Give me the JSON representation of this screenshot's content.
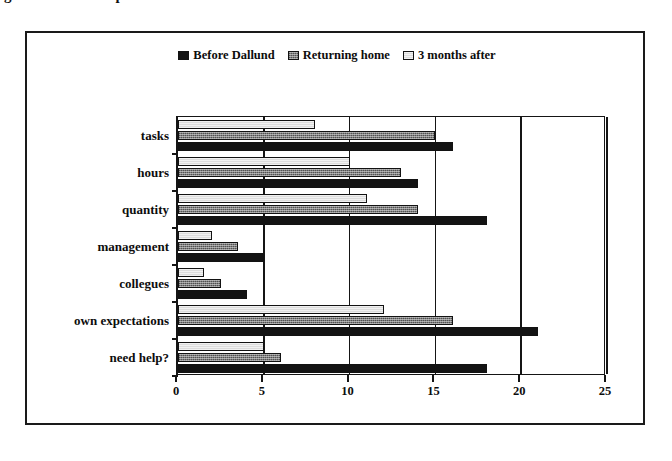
{
  "title": {
    "text": "g. 2: Problems experienced in relation to work after the course"
  },
  "legend": {
    "position": "top-center",
    "items": [
      {
        "label": "Before Dallund",
        "swatch": "solid-black-swatch",
        "color": "#131313"
      },
      {
        "label": "Returning home",
        "swatch": "hatched-gray-swatch",
        "color": "#7e7e7e"
      },
      {
        "label": "3 months after",
        "swatch": "light-gray-swatch",
        "color": "#dcdcdc"
      }
    ]
  },
  "chart_data": {
    "type": "bar",
    "orientation": "horizontal",
    "title": "g. 2: Problems experienced in relation to work after the course",
    "xlabel": "",
    "ylabel": "",
    "xlim": [
      0,
      25
    ],
    "xticks": [
      0,
      5,
      10,
      15,
      20,
      25
    ],
    "grid": true,
    "legend_position": "top-center",
    "categories": [
      "tasks",
      "hours",
      "quantity",
      "management",
      "collegues",
      "own expectations",
      "need help?"
    ],
    "series": [
      {
        "name": "Before Dallund",
        "color": "#131313",
        "values": [
          16,
          14,
          18,
          5,
          4,
          21,
          18
        ]
      },
      {
        "name": "Returning home",
        "color": "#7e7e7e",
        "values": [
          15,
          13,
          14,
          3.5,
          2.5,
          16,
          6
        ]
      },
      {
        "name": "3 months after",
        "color": "#dcdcdc",
        "values": [
          8,
          10,
          11,
          2,
          1.5,
          12,
          5
        ]
      }
    ]
  }
}
